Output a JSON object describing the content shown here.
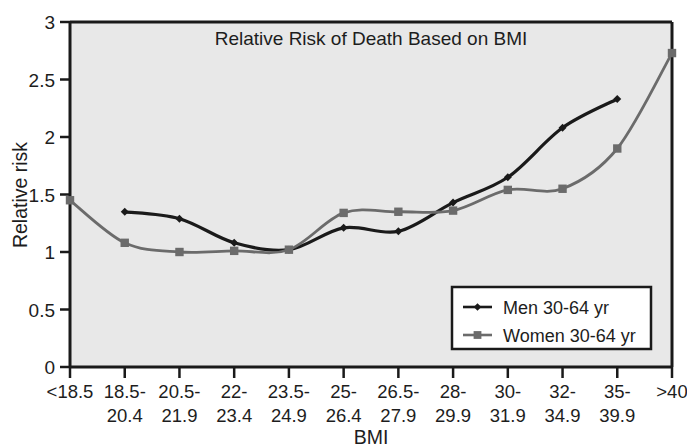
{
  "chart_data": {
    "type": "line",
    "title": "Relative Risk of Death Based on BMI",
    "xlabel": "BMI",
    "ylabel": "Relative risk",
    "categories": [
      "<18.5",
      "18.5-20.4",
      "20.5-21.9",
      "22-23.4",
      "23.5-24.9",
      "25-26.4",
      "26.5-27.9",
      "28-29.9",
      "30-31.9",
      "32-34.9",
      "35-39.9",
      ">40"
    ],
    "category_lines": [
      [
        "<18.5",
        ""
      ],
      [
        "18.5-",
        "20.4"
      ],
      [
        "20.5-",
        "21.9"
      ],
      [
        "22-",
        "23.4"
      ],
      [
        "23.5-",
        "24.9"
      ],
      [
        "25-",
        "26.4"
      ],
      [
        "26.5-",
        "27.9"
      ],
      [
        "28-",
        "29.9"
      ],
      [
        "30-",
        "31.9"
      ],
      [
        "32-",
        "34.9"
      ],
      [
        "35-",
        "39.9"
      ],
      [
        ">40",
        ""
      ]
    ],
    "series": [
      {
        "name": "Men 30-64 yr",
        "color": "#1a1a1a",
        "marker": "diamond",
        "values": [
          null,
          1.35,
          1.29,
          1.08,
          1.02,
          1.21,
          1.18,
          1.43,
          1.65,
          2.08,
          2.33,
          null
        ]
      },
      {
        "name": "Women 30-64 yr",
        "color": "#6b6b6b",
        "marker": "square",
        "values": [
          1.45,
          1.08,
          1.0,
          1.01,
          1.02,
          1.34,
          1.35,
          1.36,
          1.54,
          1.55,
          1.9,
          2.73
        ]
      }
    ],
    "ylim": [
      0,
      3
    ],
    "yticks": [
      "0",
      "0.5",
      "1",
      "1.5",
      "2",
      "2.5",
      "3"
    ],
    "ytick_values": [
      0,
      0.5,
      1,
      1.5,
      2,
      2.5,
      3
    ],
    "grid": false,
    "legend_position": "bottom-right",
    "plot_background": "#e8e8e8"
  },
  "legend": {
    "items": [
      {
        "label": "Men 30-64 yr"
      },
      {
        "label": "Women 30-64 yr"
      }
    ]
  }
}
